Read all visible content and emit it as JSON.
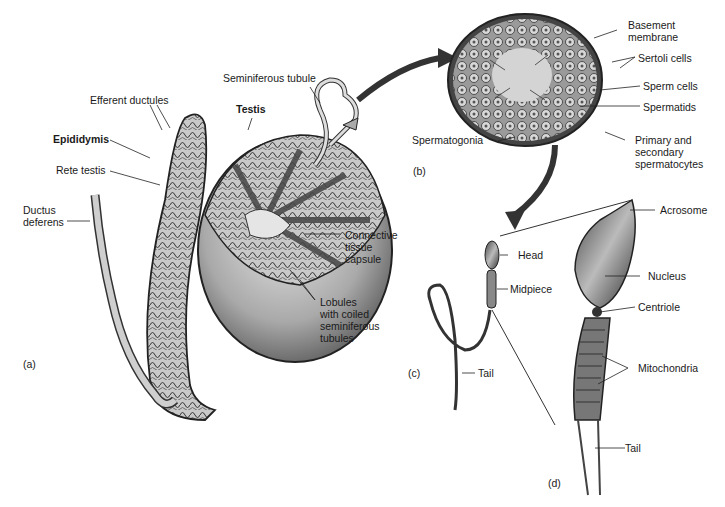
{
  "panels": {
    "a": {
      "tag": "(a)",
      "labels": {
        "seminiferous_tubule": "Seminiferous tubule",
        "efferent_ductules": "Efferent ductules",
        "testis": "Testis",
        "epididymis": "Epididymis",
        "rete_testis": "Rete testis",
        "ductus_deferens": "Ductus\ndeferens",
        "connective_tissue_capsule": "Connective\ntissue\ncapsule",
        "lobules": "Lobules\nwith coiled\nseminiferous\ntubules"
      }
    },
    "b": {
      "tag": "(b)",
      "labels": {
        "basement_membrane": "Basement\nmembrane",
        "sertoli_cells": "Sertoli cells",
        "sperm_cells": "Sperm cells",
        "spermatids": "Spermatids",
        "spermatogonia": "Spermatogonia",
        "spermatocytes": "Primary and\nsecondary\nspermatocytes"
      }
    },
    "c": {
      "tag": "(c)",
      "labels": {
        "head": "Head",
        "midpiece": "Midpiece",
        "tail": "Tail"
      }
    },
    "d": {
      "tag": "(d)",
      "labels": {
        "acrosome": "Acrosome",
        "nucleus": "Nucleus",
        "centriole": "Centriole",
        "mitochondria": "Mitochondria",
        "tail": "Tail"
      }
    }
  }
}
